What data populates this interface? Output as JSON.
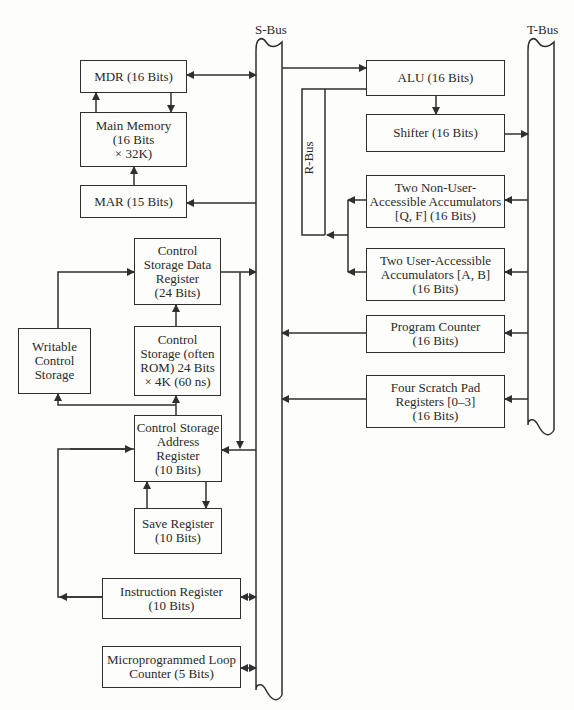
{
  "buses": {
    "s_bus": "S-Bus",
    "t_bus": "T-Bus",
    "r_bus": "R-Bus"
  },
  "left": {
    "mdr": "MDR (16 Bits)",
    "main_memory": "Main Memory\n(16 Bits\n× 32K)",
    "mar": "MAR (15 Bits)",
    "csdr": "Control\nStorage Data\nRegister\n(24 Bits)",
    "writable_cs": "Writable\nControl\nStorage",
    "control_storage": "Control\nStorage (often\nROM) 24 Bits\n× 4K (60 ns)",
    "csar": "Control Storage\nAddress\nRegister\n(10 Bits)",
    "save_register": "Save Register\n(10 Bits)",
    "instruction_register": "Instruction Register\n(10 Bits)",
    "loop_counter": "Microprogrammed Loop\nCounter (5 Bits)"
  },
  "right": {
    "alu": "ALU (16 Bits)",
    "shifter": "Shifter (16 Bits)",
    "non_user_acc": "Two Non-User-\nAccessible Accumulators\n[Q, F] (16 Bits)",
    "user_acc": "Two User-Accessible\nAccumulators [A, B]\n(16 Bits)",
    "program_counter": "Program Counter\n(16 Bits)",
    "scratch_pad": "Four Scratch Pad\nRegisters [0–3]\n(16 Bits)"
  }
}
